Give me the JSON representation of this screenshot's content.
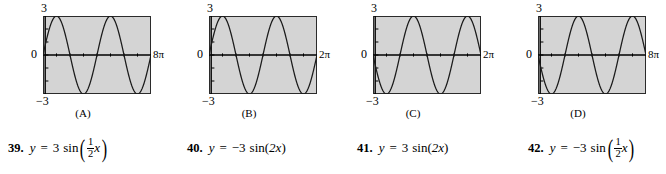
{
  "graphs": [
    {
      "id": "A",
      "caption": "(A)",
      "y_max_label": "3",
      "y_zero_label": "0",
      "y_min_label": "−3",
      "x_max_label": "8π",
      "amplitude": 3,
      "b": 0.5,
      "sign": 1,
      "x_range": [
        0,
        25.1327
      ],
      "y_range": [
        -3,
        3
      ],
      "cycles": 2,
      "starts": "up"
    },
    {
      "id": "B",
      "caption": "(B)",
      "y_max_label": "3",
      "y_zero_label": "0",
      "y_min_label": "−3",
      "x_max_label": "2π",
      "amplitude": 3,
      "b": 2,
      "sign": 1,
      "x_range": [
        0,
        6.2832
      ],
      "y_range": [
        -3,
        3
      ],
      "cycles": 2,
      "starts": "up"
    },
    {
      "id": "C",
      "caption": "(C)",
      "y_max_label": "3",
      "y_zero_label": "0",
      "y_min_label": "−3",
      "x_max_label": "2π",
      "amplitude": 3,
      "b": 2,
      "sign": -1,
      "x_range": [
        0,
        6.2832
      ],
      "y_range": [
        -3,
        3
      ],
      "cycles": 2,
      "starts": "down"
    },
    {
      "id": "D",
      "caption": "(D)",
      "y_max_label": "3",
      "y_zero_label": "0",
      "y_min_label": "−3",
      "x_max_label": "8π",
      "amplitude": 3,
      "b": 0.5,
      "sign": -1,
      "x_range": [
        0,
        25.1327
      ],
      "y_range": [
        -3,
        3
      ],
      "cycles": 2,
      "starts": "down"
    }
  ],
  "equations": [
    {
      "number": "39.",
      "lhs": "y",
      "equals": "=",
      "coefficient": "3",
      "fn": "sin",
      "open_paren": "(",
      "frac_num": "1",
      "frac_den": "2",
      "variable": "x",
      "close_paren": ")",
      "has_fraction": true,
      "inline_arg": ""
    },
    {
      "number": "40.",
      "lhs": "y",
      "equals": "=",
      "coefficient": "−3",
      "fn": "sin",
      "open_paren": "(",
      "frac_num": "",
      "frac_den": "",
      "variable": "x",
      "close_paren": ")",
      "has_fraction": false,
      "inline_arg": "2x"
    },
    {
      "number": "41.",
      "lhs": "y",
      "equals": "=",
      "coefficient": "3",
      "fn": "sin",
      "open_paren": "(",
      "frac_num": "",
      "frac_den": "",
      "variable": "x",
      "close_paren": ")",
      "has_fraction": false,
      "inline_arg": "2x"
    },
    {
      "number": "42.",
      "lhs": "y",
      "equals": "=",
      "coefficient": "−3",
      "fn": "sin",
      "open_paren": "(",
      "frac_num": "1",
      "frac_den": "2",
      "variable": "x",
      "close_paren": ")",
      "has_fraction": true,
      "inline_arg": ""
    }
  ],
  "style": {
    "plot_background": "#d4d4d4",
    "curve_color": "#1a1a1a",
    "axis_color": "#000000",
    "page_background": "#ffffff"
  },
  "chart_data": [
    {
      "type": "line",
      "title": "(A)",
      "xlabel": "",
      "ylabel": "",
      "xlim": [
        0,
        25.1327
      ],
      "ylim": [
        -3,
        3
      ],
      "xtick_labels": [
        "0",
        "8π"
      ],
      "ytick_labels": [
        "3",
        "0",
        "−3"
      ],
      "grid": false,
      "legend": "none",
      "series": [
        {
          "name": "y = 3 sin((1/2)x)",
          "equation": "y = 3*sin(0.5*x)",
          "amplitude": 3,
          "period": 12.5664,
          "points": [
            [
              0.0,
              0.0
            ],
            [
              1.5708,
              2.1213
            ],
            [
              3.1416,
              3.0
            ],
            [
              4.7124,
              2.1213
            ],
            [
              6.2832,
              0.0
            ],
            [
              7.854,
              -2.1213
            ],
            [
              9.4248,
              -3.0
            ],
            [
              10.9956,
              -2.1213
            ],
            [
              12.5664,
              0.0
            ],
            [
              14.1372,
              2.1213
            ],
            [
              15.708,
              3.0
            ],
            [
              17.2788,
              2.1213
            ],
            [
              18.8496,
              0.0
            ],
            [
              20.4204,
              -2.1213
            ],
            [
              21.9911,
              -3.0
            ],
            [
              23.5619,
              -2.1213
            ],
            [
              25.1327,
              0.0
            ]
          ]
        }
      ]
    },
    {
      "type": "line",
      "title": "(B)",
      "xlabel": "",
      "ylabel": "",
      "xlim": [
        0,
        6.2832
      ],
      "ylim": [
        -3,
        3
      ],
      "xtick_labels": [
        "0",
        "2π"
      ],
      "ytick_labels": [
        "3",
        "0",
        "−3"
      ],
      "grid": false,
      "legend": "none",
      "series": [
        {
          "name": "y = 3 sin(2x)",
          "equation": "y = 3*sin(2*x)",
          "amplitude": 3,
          "period": 3.1416,
          "points": [
            [
              0.0,
              0.0
            ],
            [
              0.3927,
              2.1213
            ],
            [
              0.7854,
              3.0
            ],
            [
              1.1781,
              2.1213
            ],
            [
              1.5708,
              0.0
            ],
            [
              1.9635,
              -2.1213
            ],
            [
              2.3562,
              -3.0
            ],
            [
              2.7489,
              -2.1213
            ],
            [
              3.1416,
              0.0
            ],
            [
              3.5343,
              2.1213
            ],
            [
              3.927,
              3.0
            ],
            [
              4.3197,
              2.1213
            ],
            [
              4.7124,
              0.0
            ],
            [
              5.1051,
              -2.1213
            ],
            [
              5.4978,
              -3.0
            ],
            [
              5.8905,
              -2.1213
            ],
            [
              6.2832,
              0.0
            ]
          ]
        }
      ]
    },
    {
      "type": "line",
      "title": "(C)",
      "xlabel": "",
      "ylabel": "",
      "xlim": [
        0,
        6.2832
      ],
      "ylim": [
        -3,
        3
      ],
      "xtick_labels": [
        "0",
        "2π"
      ],
      "ytick_labels": [
        "3",
        "0",
        "−3"
      ],
      "grid": false,
      "legend": "none",
      "series": [
        {
          "name": "y = -3 sin(2x)",
          "equation": "y = -3*sin(2*x)",
          "amplitude": 3,
          "period": 3.1416,
          "points": [
            [
              0.0,
              0.0
            ],
            [
              0.3927,
              -2.1213
            ],
            [
              0.7854,
              -3.0
            ],
            [
              1.1781,
              -2.1213
            ],
            [
              1.5708,
              0.0
            ],
            [
              1.9635,
              2.1213
            ],
            [
              2.3562,
              3.0
            ],
            [
              2.7489,
              2.1213
            ],
            [
              3.1416,
              0.0
            ],
            [
              3.5343,
              -2.1213
            ],
            [
              3.927,
              -3.0
            ],
            [
              4.3197,
              -2.1213
            ],
            [
              4.7124,
              0.0
            ],
            [
              5.1051,
              2.1213
            ],
            [
              5.4978,
              3.0
            ],
            [
              5.8905,
              2.1213
            ],
            [
              6.2832,
              0.0
            ]
          ]
        }
      ]
    },
    {
      "type": "line",
      "title": "(D)",
      "xlabel": "",
      "ylabel": "",
      "xlim": [
        0,
        25.1327
      ],
      "ylim": [
        -3,
        3
      ],
      "xtick_labels": [
        "0",
        "8π"
      ],
      "ytick_labels": [
        "3",
        "0",
        "−3"
      ],
      "grid": false,
      "legend": "none",
      "series": [
        {
          "name": "y = -3 sin((1/2)x)",
          "equation": "y = -3*sin(0.5*x)",
          "amplitude": 3,
          "period": 12.5664,
          "points": [
            [
              0.0,
              0.0
            ],
            [
              1.5708,
              -2.1213
            ],
            [
              3.1416,
              -3.0
            ],
            [
              4.7124,
              -2.1213
            ],
            [
              6.2832,
              0.0
            ],
            [
              7.854,
              2.1213
            ],
            [
              9.4248,
              3.0
            ],
            [
              10.9956,
              2.1213
            ],
            [
              12.5664,
              0.0
            ],
            [
              14.1372,
              -2.1213
            ],
            [
              15.708,
              -3.0
            ],
            [
              17.2788,
              -2.1213
            ],
            [
              18.8496,
              0.0
            ],
            [
              20.4204,
              2.1213
            ],
            [
              21.9911,
              3.0
            ],
            [
              23.5619,
              2.1213
            ],
            [
              25.1327,
              0.0
            ]
          ]
        }
      ]
    }
  ]
}
